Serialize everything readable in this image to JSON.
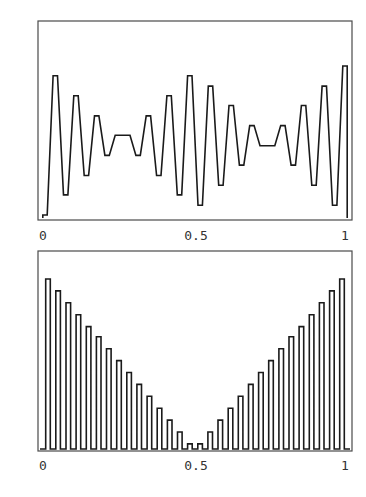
{
  "colors": {
    "frame": "#4a4a4a",
    "trace": "#1a1a1a",
    "label": "#333333",
    "background": "#ffffff"
  },
  "chart_data": [
    {
      "type": "line",
      "title": "",
      "xlabel": "",
      "ylabel": "",
      "xlim": [
        0,
        1
      ],
      "ylim": [
        -1.15,
        1.15
      ],
      "grid": false,
      "legend": null,
      "x_ticks": [
        0,
        0.5,
        1
      ],
      "x_tick_labels": [
        "0",
        "0.5",
        "1"
      ],
      "y_ticks": [],
      "style": "step (square wave, alternating sign each sample)",
      "n_samples": 30,
      "envelope": "triangular |1 - 4x| folded (peaks at x=0, 0.5, 1; near zero at x=0.25, 0.75)",
      "series": [
        {
          "name": "alternating square wave",
          "values": [
            -1.0,
            0.87,
            -0.73,
            0.6,
            -0.47,
            0.33,
            -0.2,
            0.07,
            0.07,
            -0.2,
            0.33,
            -0.47,
            0.6,
            -0.73,
            0.87,
            -0.87,
            0.73,
            -0.6,
            0.47,
            -0.33,
            0.2,
            -0.07,
            -0.07,
            0.2,
            -0.33,
            0.47,
            -0.6,
            0.73,
            -0.87,
            1.0
          ]
        }
      ]
    },
    {
      "type": "bar",
      "title": "",
      "xlabel": "",
      "ylabel": "",
      "xlim": [
        0,
        1
      ],
      "ylim": [
        0,
        1.15
      ],
      "grid": false,
      "legend": null,
      "x_ticks": [
        0,
        0.5,
        1
      ],
      "x_tick_labels": [
        "0",
        "0.5",
        "1"
      ],
      "y_ticks": [],
      "style": "pulse train (outlined bars from baseline)",
      "n_samples": 30,
      "envelope": "V-shape |1 - 2x|",
      "series": [
        {
          "name": "rectified pulse amplitude",
          "values": [
            1.0,
            0.93,
            0.86,
            0.79,
            0.72,
            0.66,
            0.59,
            0.52,
            0.45,
            0.38,
            0.31,
            0.24,
            0.17,
            0.1,
            0.03,
            0.03,
            0.1,
            0.17,
            0.24,
            0.31,
            0.38,
            0.45,
            0.52,
            0.59,
            0.66,
            0.72,
            0.79,
            0.86,
            0.93,
            1.0
          ]
        }
      ]
    }
  ]
}
